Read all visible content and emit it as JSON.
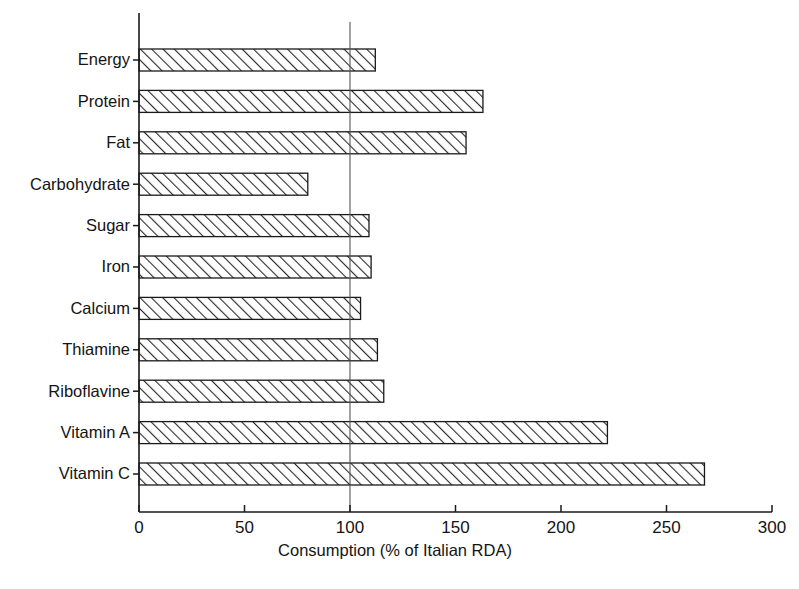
{
  "chart_data": {
    "type": "bar",
    "orientation": "horizontal",
    "title": "",
    "subtitle": "",
    "xlabel": "Consumption (% of Italian RDA)",
    "ylabel": "",
    "xlim": [
      0,
      300
    ],
    "xticks": [
      0,
      50,
      100,
      150,
      200,
      250,
      300
    ],
    "xticklabels": [
      "0",
      "50",
      "100",
      "150",
      "200",
      "250",
      "300"
    ],
    "grid": false,
    "legend": null,
    "reference_line": {
      "value": 100,
      "orientation": "vertical",
      "label": ""
    },
    "bar_style": {
      "fill": "diagonal-hatch",
      "hatch_direction": "forward-slash",
      "edge_color": "#1a1a1a",
      "face_color": "#ffffff"
    },
    "categories": [
      "Energy",
      "Protein",
      "Fat",
      "Carbohydrate",
      "Sugar",
      "Iron",
      "Calcium",
      "Thiamine",
      "Riboflavine",
      "Vitamin A",
      "Vitamin C"
    ],
    "values": [
      112,
      163,
      155,
      80,
      109,
      110,
      105,
      113,
      116,
      222,
      268
    ]
  },
  "axis": {
    "x_title": "Consumption (% of Italian RDA)",
    "ticks": [
      "0",
      "50",
      "100",
      "150",
      "200",
      "250",
      "300"
    ]
  },
  "bars": [
    {
      "label": "Energy",
      "value": 112
    },
    {
      "label": "Protein",
      "value": 163
    },
    {
      "label": "Fat",
      "value": 155
    },
    {
      "label": "Carbohydrate",
      "value": 80
    },
    {
      "label": "Sugar",
      "value": 109
    },
    {
      "label": "Iron",
      "value": 110
    },
    {
      "label": "Calcium",
      "value": 105
    },
    {
      "label": "Thiamine",
      "value": 113
    },
    {
      "label": "Riboflavine",
      "value": 116
    },
    {
      "label": "Vitamin A",
      "value": 222
    },
    {
      "label": "Vitamin C",
      "value": 268
    }
  ]
}
